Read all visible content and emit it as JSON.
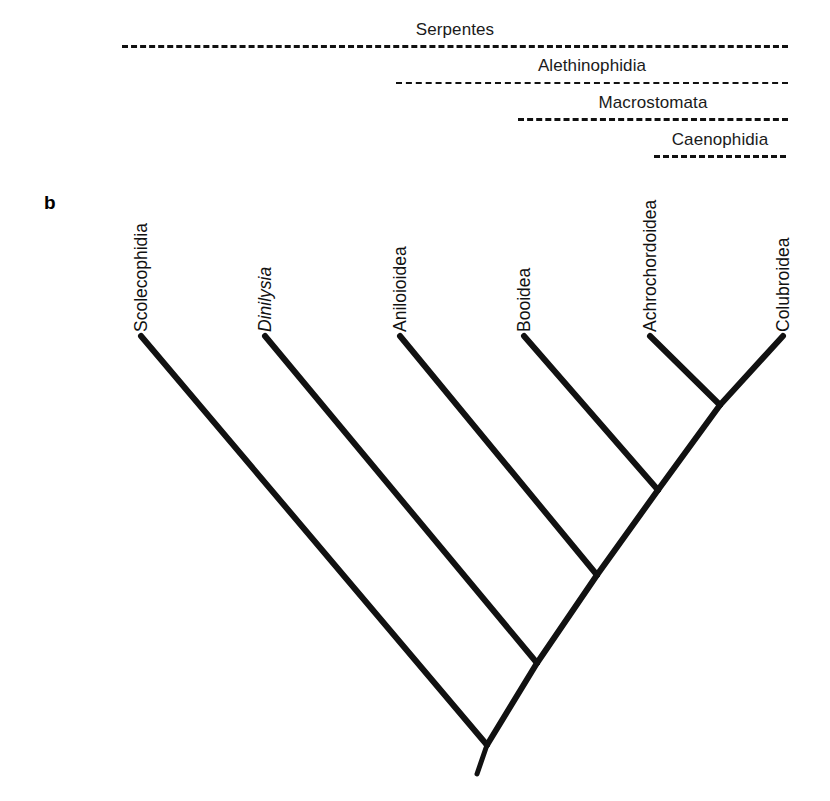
{
  "figure": {
    "panel_letter": "b",
    "background": "#ffffff",
    "line_color": "#111111",
    "width": 830,
    "height": 801
  },
  "clades": [
    {
      "name": "Serpentes",
      "label": "Serpentes",
      "left": 122,
      "right": 788,
      "top": 14,
      "dash_style": "coarse"
    },
    {
      "name": "Alethinophidia",
      "label": "Alethinophidia",
      "left": 396,
      "right": 788,
      "top": 50,
      "dash_style": "fine"
    },
    {
      "name": "Macrostomata",
      "label": "Macrostomata",
      "left": 518,
      "right": 788,
      "top": 87,
      "dash_style": "coarse"
    },
    {
      "name": "Caenophidia",
      "label": "Caenophidia",
      "left": 654,
      "right": 786,
      "top": 124,
      "dash_style": "coarse"
    }
  ],
  "taxa": [
    {
      "name": "Scolecophidia",
      "label": "Scolecophidia",
      "italic": false,
      "tip_x": 141,
      "tip_y": 336,
      "label_x": 150,
      "label_y": 332
    },
    {
      "name": "Dinilysia",
      "label": "Dinilysia",
      "italic": true,
      "tip_x": 265,
      "tip_y": 336,
      "label_x": 274,
      "label_y": 332
    },
    {
      "name": "Aniloioidea",
      "label": "Aniloioidea",
      "italic": false,
      "tip_x": 400,
      "tip_y": 336,
      "label_x": 409,
      "label_y": 332
    },
    {
      "name": "Booidea",
      "label": "Booidea",
      "italic": false,
      "tip_x": 524,
      "tip_y": 336,
      "label_x": 533,
      "label_y": 332
    },
    {
      "name": "Achrochordoidea",
      "label": "Achrochordoidea",
      "italic": false,
      "tip_x": 650,
      "tip_y": 336,
      "label_x": 659,
      "label_y": 332
    },
    {
      "name": "Colubroidea",
      "label": "Colubroidea",
      "italic": false,
      "tip_x": 783,
      "tip_y": 336,
      "label_x": 792,
      "label_y": 332
    }
  ],
  "nodes": [
    {
      "name": "root",
      "x": 487,
      "y": 745
    },
    {
      "name": "alethinophidia",
      "x": 537,
      "y": 663
    },
    {
      "name": "macrostomata",
      "x": 597,
      "y": 575
    },
    {
      "name": "booidea-split",
      "x": 658,
      "y": 490
    },
    {
      "name": "caenophidia",
      "x": 720,
      "y": 405
    }
  ],
  "branches": [
    {
      "name": "branch-scolecophidia",
      "x1": 141,
      "y1": 336,
      "x2": 487,
      "y2": 745
    },
    {
      "name": "branch-dinilysia",
      "x1": 265,
      "y1": 336,
      "x2": 537,
      "y2": 663
    },
    {
      "name": "branch-aniloioidea",
      "x1": 400,
      "y1": 336,
      "x2": 597,
      "y2": 575
    },
    {
      "name": "branch-booidea",
      "x1": 524,
      "y1": 336,
      "x2": 658,
      "y2": 490
    },
    {
      "name": "branch-achrochordoidea",
      "x1": 650,
      "y1": 336,
      "x2": 720,
      "y2": 405
    },
    {
      "name": "branch-colubroidea",
      "x1": 783,
      "y1": 336,
      "x2": 720,
      "y2": 405
    },
    {
      "name": "internal-caenophidia",
      "x1": 720,
      "y1": 405,
      "x2": 658,
      "y2": 490
    },
    {
      "name": "internal-macrostomata",
      "x1": 658,
      "y1": 490,
      "x2": 597,
      "y2": 575
    },
    {
      "name": "internal-alethinophidia",
      "x1": 597,
      "y1": 575,
      "x2": 537,
      "y2": 663
    },
    {
      "name": "internal-serpentes",
      "x1": 537,
      "y1": 663,
      "x2": 487,
      "y2": 745
    },
    {
      "name": "root-stem",
      "x1": 487,
      "y1": 745,
      "x2": 477,
      "y2": 774
    }
  ]
}
